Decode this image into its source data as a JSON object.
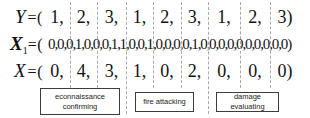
{
  "figure": {
    "equals_open": "=(",
    "close_paren": ")",
    "comma": ",",
    "rows": {
      "y": {
        "label": "Y",
        "subscript": "",
        "values": [
          "1",
          "2",
          "3",
          "1",
          "2",
          "3",
          "1",
          "2",
          "3"
        ]
      },
      "x1": {
        "label": "X",
        "subscript": "1",
        "values": [
          "0",
          "0",
          "0",
          "1",
          "0",
          "0",
          "0",
          "1",
          "1",
          "0",
          "0",
          "1",
          "0",
          "0",
          "0",
          "0",
          "1",
          "0",
          "0",
          "0",
          "0",
          "0",
          "0",
          "0",
          "0",
          "0",
          "0"
        ]
      },
      "x": {
        "label": "X",
        "subscript": "",
        "values": [
          "0",
          "4",
          "3",
          "1",
          "0",
          "2",
          "0",
          "0",
          "0"
        ]
      }
    },
    "task_boxes": [
      {
        "lines": [
          "econnaissance",
          "confirming"
        ]
      },
      {
        "lines": [
          "fire attacking"
        ]
      },
      {
        "lines": [
          "damage evaluating"
        ]
      }
    ],
    "colors": {
      "background": "#ffffff",
      "text": "#121212",
      "dashed_line": "#a8a8a8",
      "box_border": "#3c3c3c"
    }
  }
}
